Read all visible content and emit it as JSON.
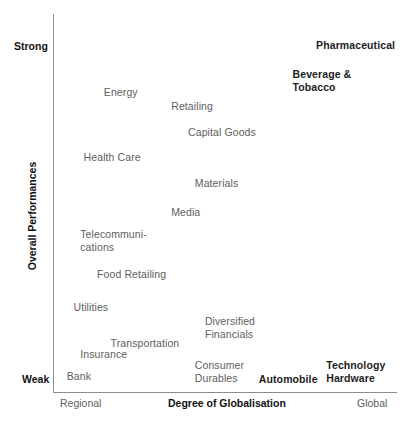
{
  "chart_data": {
    "type": "scatter",
    "title": "",
    "xlabel": "Degree of Globalisation",
    "ylabel": "Overall Performances",
    "x_axis_low_label": "Regional",
    "x_axis_high_label": "Global",
    "y_axis_low_label": "Weak",
    "y_axis_high_label": "Strong",
    "grid": false,
    "legend": "none",
    "xlim": [
      0,
      100
    ],
    "ylim": [
      0,
      100
    ],
    "note": "Labels positioned as text markers; x = degree of globalisation, y = overall performance, both estimated from pixel positions on a 0-100 scale.",
    "points": [
      {
        "label": "Pharmaceutical",
        "x": 76,
        "y": 96,
        "emphasis": "bold"
      },
      {
        "label": "Beverage &\nTobacco",
        "x": 69,
        "y": 88,
        "emphasis": "bold"
      },
      {
        "label": "Energy",
        "x": 13,
        "y": 83,
        "emphasis": "normal"
      },
      {
        "label": "Retailing",
        "x": 33,
        "y": 79,
        "emphasis": "normal"
      },
      {
        "label": "Capital Goods",
        "x": 38,
        "y": 72,
        "emphasis": "normal"
      },
      {
        "label": "Health Care",
        "x": 7,
        "y": 65,
        "emphasis": "normal"
      },
      {
        "label": "Materials",
        "x": 40,
        "y": 58,
        "emphasis": "normal"
      },
      {
        "label": "Media",
        "x": 33,
        "y": 50,
        "emphasis": "normal"
      },
      {
        "label": "Telecommuni-\ncations",
        "x": 6,
        "y": 44,
        "emphasis": "normal"
      },
      {
        "label": "Food Retailing",
        "x": 11,
        "y": 33,
        "emphasis": "normal"
      },
      {
        "label": "Utilities",
        "x": 4,
        "y": 24,
        "emphasis": "normal"
      },
      {
        "label": "Diversified\nFinancials",
        "x": 43,
        "y": 20,
        "emphasis": "normal"
      },
      {
        "label": "Transportation",
        "x": 15,
        "y": 14,
        "emphasis": "normal"
      },
      {
        "label": "Insurance",
        "x": 6,
        "y": 11,
        "emphasis": "normal"
      },
      {
        "label": "Consumer\nDurables",
        "x": 40,
        "y": 8,
        "emphasis": "normal"
      },
      {
        "label": "Bank",
        "x": 2,
        "y": 5,
        "emphasis": "normal"
      },
      {
        "label": "Automobile",
        "x": 59,
        "y": 4,
        "emphasis": "bold"
      },
      {
        "label": "Technology\nHardware",
        "x": 79,
        "y": 8,
        "emphasis": "bold"
      }
    ]
  },
  "labels": {
    "point_0": "Pharmaceutical",
    "point_1": "Beverage &\nTobacco",
    "point_2": "Energy",
    "point_3": "Retailing",
    "point_4": "Capital Goods",
    "point_5": "Health Care",
    "point_6": "Materials",
    "point_7": "Media",
    "point_8": "Telecommuni-\ncations",
    "point_9": "Food Retailing",
    "point_10": "Utilities",
    "point_11": "Diversified\nFinancials",
    "point_12": "Transportation",
    "point_13": "Insurance",
    "point_14": "Consumer\nDurables",
    "point_15": "Bank",
    "point_16": "Automobile",
    "point_17": "Technology\nHardware"
  },
  "axes": {
    "y_title": "Overall Performances",
    "x_title": "Degree of Globalisation",
    "y_high": "Strong",
    "y_low": "Weak",
    "x_low": "Regional",
    "x_high": "Global"
  },
  "colors": {
    "axis_line": "#8c8c8c",
    "label_gray": "#5e5e5e",
    "label_bold": "#1d1d1d",
    "background": "#ffffff"
  }
}
